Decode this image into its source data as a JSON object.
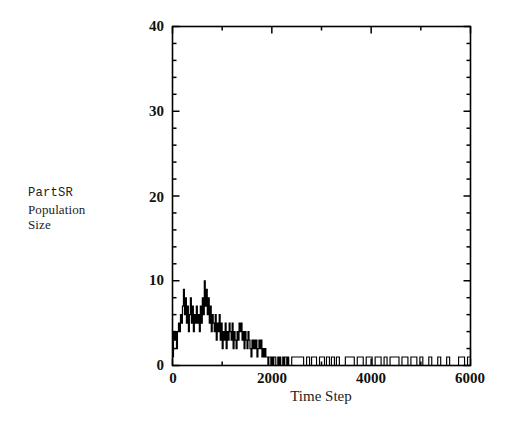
{
  "chart_data": {
    "type": "line",
    "title": "",
    "subtitle": "",
    "xlabel": "Time Step",
    "ylabel": "PartSR Population Size",
    "ylabel_lines": [
      "PartSR",
      "Population",
      "Size"
    ],
    "xlim": [
      0,
      6000
    ],
    "ylim": [
      0,
      40
    ],
    "xticks": [
      0,
      2000,
      4000,
      6000
    ],
    "xtick_labels": [
      "0",
      "2000",
      "4000",
      "6000"
    ],
    "yticks": [
      0,
      10,
      20,
      30,
      40
    ],
    "ytick_labels": [
      "0",
      "10",
      "20",
      "30",
      "40"
    ],
    "x_minor_tick_interval": 1000,
    "y_minor_tick_interval": 2,
    "grid": false,
    "legend": null,
    "legend_position": "none",
    "line_color": "#000000",
    "line_width": 1,
    "series": [
      {
        "name": "PartSR Population Size",
        "x": [
          0,
          20,
          40,
          60,
          80,
          100,
          120,
          140,
          160,
          180,
          200,
          220,
          240,
          260,
          280,
          300,
          320,
          340,
          360,
          380,
          400,
          420,
          440,
          460,
          480,
          500,
          520,
          540,
          560,
          580,
          600,
          620,
          640,
          660,
          680,
          700,
          720,
          740,
          760,
          780,
          800,
          820,
          840,
          860,
          880,
          900,
          920,
          940,
          960,
          980,
          1000,
          1020,
          1040,
          1060,
          1080,
          1100,
          1120,
          1140,
          1160,
          1180,
          1200,
          1220,
          1240,
          1260,
          1280,
          1300,
          1320,
          1340,
          1360,
          1380,
          1400,
          1420,
          1440,
          1460,
          1480,
          1500,
          1520,
          1540,
          1560,
          1580,
          1600,
          1620,
          1640,
          1660,
          1680,
          1700,
          1720,
          1740,
          1760,
          1780,
          1800,
          1820,
          1840,
          1860,
          1880,
          1900,
          1920,
          1940,
          1960,
          1980,
          2000,
          2020,
          2040,
          2060,
          2080,
          2100,
          2120,
          2140,
          2160,
          2180,
          2200,
          2220,
          2240,
          2260,
          2280,
          2300,
          2320,
          2340,
          2360,
          2380,
          2400,
          2600,
          2640,
          2700,
          2760,
          2800,
          2860,
          2900,
          2960,
          3000,
          3060,
          3100,
          3160,
          3200,
          3260,
          3300,
          3360,
          3420,
          3480,
          3540,
          3600,
          3660,
          3720,
          3780,
          3840,
          3900,
          3960,
          4020,
          4080,
          4140,
          4200,
          4260,
          4320,
          4380,
          4440,
          4500,
          4560,
          4620,
          4680,
          4740,
          4800,
          4860,
          4920,
          4980,
          5040,
          5100,
          5160,
          5220,
          5280,
          5340,
          5400,
          5460,
          5520,
          5580,
          5640,
          5700,
          5760,
          5820,
          5880,
          5940,
          6000
        ],
        "values": [
          1,
          4,
          3,
          4,
          2,
          4,
          5,
          4,
          6,
          5,
          7,
          9,
          6,
          8,
          5,
          7,
          4,
          6,
          8,
          5,
          7,
          4,
          6,
          5,
          7,
          5,
          6,
          4,
          7,
          5,
          8,
          6,
          10,
          7,
          9,
          6,
          8,
          5,
          7,
          4,
          6,
          5,
          4,
          6,
          3,
          5,
          4,
          6,
          3,
          5,
          2,
          4,
          3,
          5,
          2,
          4,
          3,
          5,
          4,
          3,
          5,
          2,
          4,
          3,
          2,
          4,
          3,
          5,
          4,
          5,
          3,
          4,
          2,
          4,
          3,
          2,
          4,
          3,
          2,
          1,
          3,
          2,
          3,
          2,
          3,
          1,
          2,
          3,
          2,
          3,
          1,
          2,
          1,
          2,
          1,
          1,
          0,
          1,
          1,
          0,
          1,
          0,
          1,
          1,
          0,
          0,
          1,
          0,
          1,
          0,
          0,
          1,
          0,
          1,
          1,
          0,
          1,
          0,
          0,
          0,
          1,
          1,
          0,
          1,
          0,
          1,
          1,
          0,
          1,
          1,
          0,
          1,
          0,
          1,
          0,
          1,
          0,
          0,
          1,
          1,
          1,
          0,
          1,
          1,
          0,
          1,
          1,
          0,
          1,
          1,
          0,
          1,
          0,
          1,
          1,
          1,
          0,
          1,
          1,
          0,
          1,
          1,
          0,
          1,
          0,
          0,
          1,
          0,
          0,
          1,
          0,
          0,
          1,
          0,
          0,
          0,
          1,
          1,
          0,
          1,
          2
        ]
      }
    ]
  },
  "axes": {
    "frame_color": "#000000",
    "background": "#ffffff"
  }
}
